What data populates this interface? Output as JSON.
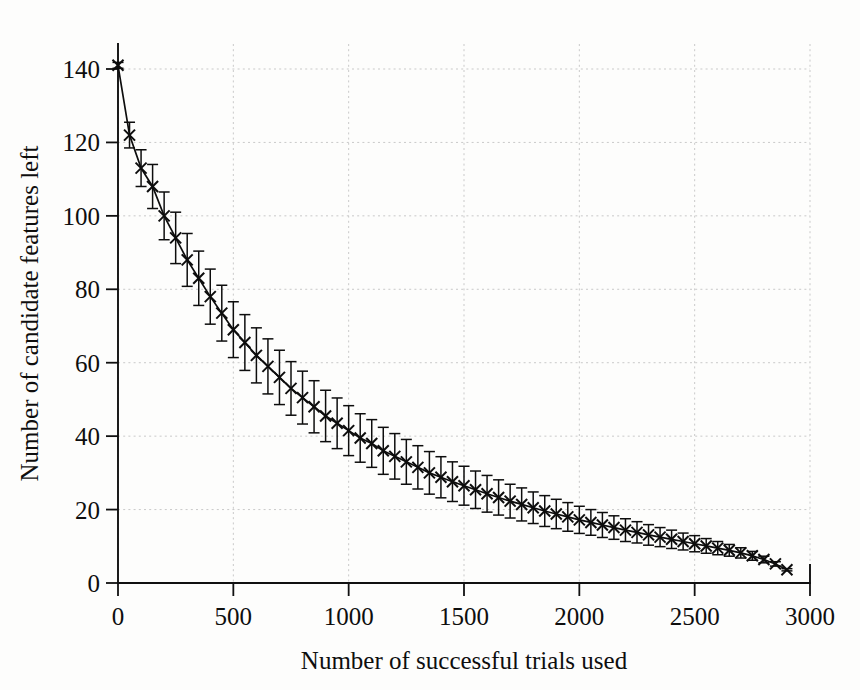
{
  "figure": {
    "background_color": "#fdfdfc",
    "marker_color": "#0d0d0d",
    "grid_color": "#c9c9c9",
    "axis_color": "#101010"
  },
  "chart_data": {
    "type": "line",
    "title": "",
    "subtitle": "",
    "xlabel": "Number of successful trials used",
    "ylabel": "Number of candidate features left",
    "xlim": [
      0,
      3000
    ],
    "ylim": [
      0,
      148
    ],
    "xticks": [
      0,
      500,
      1000,
      1500,
      2000,
      2500,
      3000
    ],
    "yticks": [
      0,
      20,
      40,
      60,
      80,
      100,
      120,
      140
    ],
    "xticklabels": [
      "0",
      "500",
      "1000",
      "1500",
      "2000",
      "2500",
      "3000"
    ],
    "yticklabels": [
      "0",
      "20",
      "40",
      "60",
      "80",
      "100",
      "120",
      "140"
    ],
    "grid": true,
    "grid_style": "dotted",
    "legend": null,
    "legend_position": "none",
    "marker_style": "x",
    "has_error_bars": true,
    "error_bar_style": "vertical-capped",
    "series": [
      {
        "name": "candidate features remaining",
        "x": [
          0,
          50,
          100,
          150,
          200,
          250,
          300,
          350,
          400,
          450,
          500,
          550,
          600,
          650,
          700,
          750,
          800,
          850,
          900,
          950,
          1000,
          1050,
          1100,
          1150,
          1200,
          1250,
          1300,
          1350,
          1400,
          1450,
          1500,
          1550,
          1600,
          1650,
          1700,
          1750,
          1800,
          1850,
          1900,
          1950,
          2000,
          2050,
          2100,
          2150,
          2200,
          2250,
          2300,
          2350,
          2400,
          2450,
          2500,
          2550,
          2600,
          2650,
          2700,
          2750,
          2800,
          2850,
          2900
        ],
        "values": [
          141.0,
          122.0,
          113.0,
          108.0,
          100.0,
          94.0,
          88.0,
          83.0,
          78.0,
          73.5,
          69.0,
          65.5,
          62.0,
          59.0,
          56.0,
          53.0,
          50.5,
          48.0,
          45.5,
          43.5,
          41.5,
          39.5,
          38.0,
          36.0,
          34.5,
          33.0,
          31.5,
          30.0,
          28.8,
          27.6,
          26.5,
          25.4,
          24.3,
          23.3,
          22.3,
          21.4,
          20.5,
          19.6,
          18.8,
          18.0,
          17.2,
          16.5,
          15.8,
          15.1,
          14.4,
          13.8,
          13.1,
          12.5,
          11.9,
          11.3,
          10.7,
          10.1,
          9.5,
          8.9,
          8.2,
          7.4,
          6.4,
          5.2,
          3.6
        ],
        "error": [
          0.8,
          3.5,
          5.0,
          6.0,
          6.5,
          7.0,
          7.2,
          7.4,
          7.5,
          7.6,
          7.6,
          7.6,
          7.5,
          7.5,
          7.4,
          7.3,
          7.2,
          7.1,
          7.0,
          6.9,
          6.8,
          6.6,
          6.5,
          6.4,
          6.2,
          6.1,
          5.9,
          5.8,
          5.6,
          5.4,
          5.3,
          5.1,
          5.0,
          4.8,
          4.6,
          4.5,
          4.3,
          4.2,
          4.0,
          3.9,
          3.7,
          3.5,
          3.4,
          3.2,
          3.1,
          2.9,
          2.8,
          2.6,
          2.5,
          2.3,
          2.2,
          2.0,
          1.8,
          1.6,
          1.4,
          1.2,
          0.9,
          0.6,
          0.3
        ]
      }
    ]
  },
  "bleed_text": {
    "top_fragment": "",
    "note": ""
  }
}
